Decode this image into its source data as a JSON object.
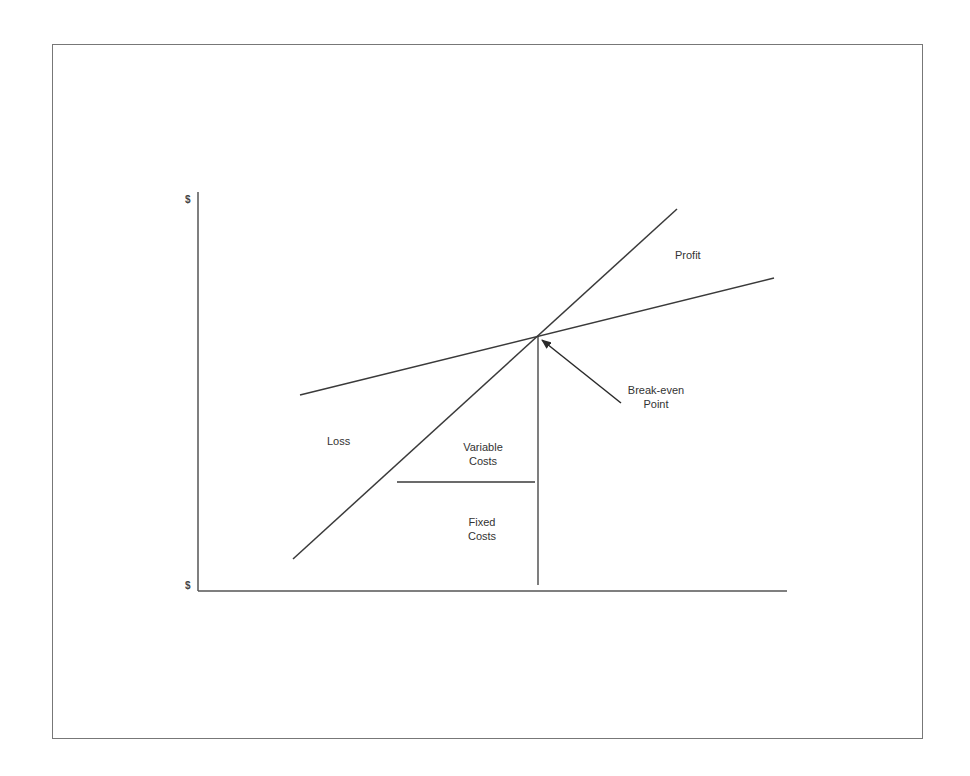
{
  "diagram": {
    "type": "break-even chart",
    "axes": {
      "y_top_label": "$",
      "origin_label": "$"
    },
    "labels": {
      "profit": "Profit",
      "loss": "Loss",
      "break_even_line1": "Break-even",
      "break_even_line2": "Point",
      "variable_costs_line1": "Variable",
      "variable_costs_line2": "Costs",
      "fixed_costs_line1": "Fixed",
      "fixed_costs_line2": "Costs"
    },
    "lines": [
      {
        "name": "revenue-line",
        "from": [
          293,
          559
        ],
        "to": [
          677,
          209
        ]
      },
      {
        "name": "total-cost-line",
        "from": [
          300,
          395
        ],
        "to": [
          774,
          278
        ]
      },
      {
        "name": "break-even-vertical",
        "from": [
          538,
          336
        ],
        "to": [
          538,
          585
        ]
      },
      {
        "name": "fixed-variable-divider",
        "from": [
          397,
          482
        ],
        "to": [
          535,
          482
        ]
      }
    ],
    "break_even_point": [
      538,
      336
    ],
    "line_color": "#3a3a3a"
  }
}
